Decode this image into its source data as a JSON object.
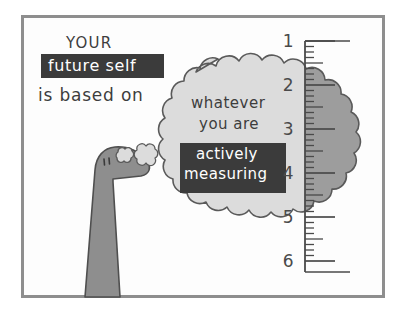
{
  "image": {
    "title": "your future self is based on whatever you are actively measuring",
    "kind": "hand-drawn-cartoon",
    "background_color": "#ffffff",
    "frame_color": "#8e8e8e",
    "ink_color": "#3d3d3d",
    "highlight_box_color": "#3b3b3b",
    "highlight_text_color": "#ffffff",
    "creature_fill": "#8c8c8c",
    "creature_outline": "#4f4f4f",
    "bubble_fill_light": "#d9d9d9",
    "bubble_fill_shaded": "#9a9a9a",
    "bubble_outline": "#555555"
  },
  "caption": {
    "line1": "YOUR",
    "highlight": "future self",
    "line3": "is based on"
  },
  "thought_bubble": {
    "line1": "whatever",
    "line2": "you are",
    "highlight_line1": "actively",
    "highlight_line2": "measuring"
  },
  "ruler": {
    "orientation": "vertical",
    "labels": [
      "1",
      "2",
      "3",
      "4",
      "5",
      "6"
    ],
    "label_y": [
      41,
      85,
      129,
      173,
      217,
      261
    ],
    "spine_x": 305,
    "major_tick_length": 30,
    "half_tick_length": 18,
    "minor_tick_length": 9,
    "minor_ticks_per_unit": 8
  },
  "creature": {
    "name": "long-necked-dinosaur",
    "eyes": 2
  },
  "puffs": {
    "count": 2,
    "labels": [
      "small-thought-puff",
      "large-thought-puff"
    ]
  }
}
